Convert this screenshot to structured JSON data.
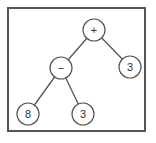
{
  "diagram": {
    "type": "expression-tree",
    "nodes": [
      {
        "id": "root",
        "label": "+",
        "cx": 94,
        "cy": 30
      },
      {
        "id": "minus",
        "label": "−",
        "cx": 61,
        "cy": 68
      },
      {
        "id": "right3",
        "label": "3",
        "cx": 130,
        "cy": 67
      },
      {
        "id": "eight",
        "label": "8",
        "cx": 28,
        "cy": 114
      },
      {
        "id": "bottom3",
        "label": "3",
        "cx": 83,
        "cy": 114
      }
    ],
    "edges": [
      {
        "from": "root",
        "to": "minus"
      },
      {
        "from": "root",
        "to": "right3"
      },
      {
        "from": "minus",
        "to": "eight"
      },
      {
        "from": "minus",
        "to": "bottom3"
      }
    ],
    "node_radius": 11,
    "colors": {
      "stroke": "#555555",
      "text": "#333333",
      "background": "#ffffff"
    }
  }
}
